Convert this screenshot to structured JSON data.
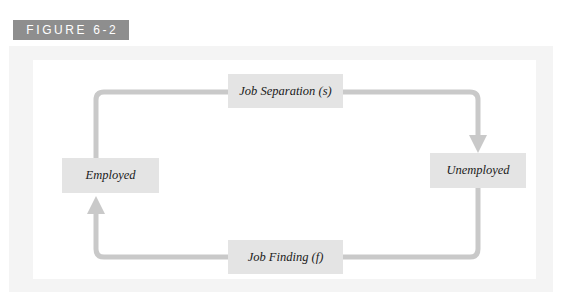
{
  "figure": {
    "banner_label": "FIGURE 6-2",
    "banner_color": "#8e8e8e",
    "frame_color": "#f4f4f4",
    "panel_color": "#ffffff"
  },
  "diagram": {
    "type": "flow-cycle",
    "connector_color": "#c9c9c9",
    "box_color": "#e4e4e4",
    "nodes": [
      {
        "id": "employed",
        "label": "Employed"
      },
      {
        "id": "unemployed",
        "label": "Unemployed"
      },
      {
        "id": "job-separation",
        "label": "Job Separation (s)"
      },
      {
        "id": "job-finding",
        "label": "Job Finding (f)"
      }
    ],
    "edges": [
      {
        "id": "separation-flow",
        "from": "employed",
        "to": "unemployed",
        "via": "job-separation",
        "direction": "clockwise",
        "arrowhead": "down-into-unemployed"
      },
      {
        "id": "finding-flow",
        "from": "unemployed",
        "to": "employed",
        "via": "job-finding",
        "direction": "counter-clockwise",
        "arrowhead": "up-into-employed"
      }
    ]
  }
}
